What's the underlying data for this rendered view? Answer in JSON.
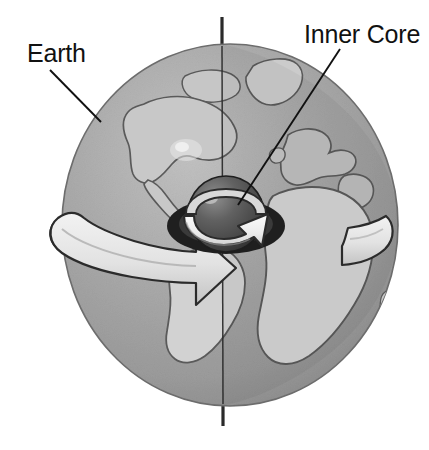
{
  "figure": {
    "background_color": "#ffffff",
    "width": 429,
    "height": 450
  },
  "labels": {
    "earth": "Earth",
    "inner_core": "Inner Core"
  },
  "colors": {
    "background": "#ffffff",
    "ocean_gray": "#a6a6a6",
    "ocean_shadow": "#8f8f8f",
    "land_light": "#cfcfcf",
    "land_mid": "#bdbdbd",
    "outline": "#4a4a4a",
    "core_dark": "#3a3a3a",
    "core_mid": "#5a5a5a",
    "core_highlight": "#9a9a9a",
    "arrow_fill": "#ededed",
    "arrow_shade": "#c4c4c4",
    "arrow_outline": "#2b2b2b",
    "label_text": "#111111",
    "leader_line": "#111111",
    "axis_line": "#2a2a2a"
  },
  "geometry": {
    "globe": {
      "cx": 230,
      "cy": 225,
      "rx": 168,
      "ry": 181
    },
    "core": {
      "cx": 226,
      "cy": 214,
      "r": 38
    },
    "axis": {
      "x": 222,
      "y_top": 17,
      "y_bottom": 426
    },
    "earth_leader": {
      "x1": 50,
      "y1": 70,
      "x2": 101,
      "y2": 122
    },
    "core_leader": {
      "x1": 340,
      "y1": 49,
      "x2": 238,
      "y2": 205
    }
  },
  "elements": {
    "globe_name": "earth-globe",
    "core_name": "inner-core-sphere",
    "rotation_axis_name": "rotation-axis",
    "earth_rotation_arrow_name": "earth-rotation-arrow",
    "core_rotation_arrow_name": "inner-core-rotation-arrow",
    "continents": [
      "greenland",
      "north-america",
      "south-america",
      "europe",
      "africa",
      "middle-east"
    ]
  }
}
